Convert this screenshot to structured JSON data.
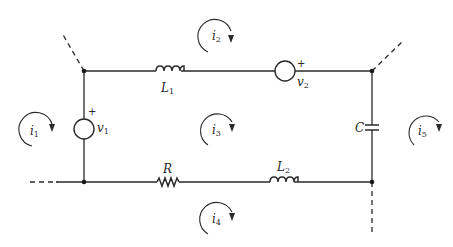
{
  "diagram": {
    "type": "circuit",
    "colors": {
      "ink": "#2a2a2a",
      "background": "#ffffff"
    },
    "components": {
      "L1": {
        "symbol": "L",
        "sub": "1",
        "kind": "inductor",
        "branch": "top"
      },
      "v2": {
        "symbol": "v",
        "sub": "2",
        "kind": "voltage-source",
        "branch": "top",
        "polarity": "+"
      },
      "v1": {
        "symbol": "v",
        "sub": "1",
        "kind": "voltage-source",
        "branch": "left",
        "polarity": "+"
      },
      "C": {
        "symbol": "C",
        "sub": "",
        "kind": "capacitor",
        "branch": "right"
      },
      "R": {
        "symbol": "R",
        "sub": "",
        "kind": "resistor",
        "branch": "bottom"
      },
      "L2": {
        "symbol": "L",
        "sub": "2",
        "kind": "inductor",
        "branch": "bottom"
      }
    },
    "mesh_currents": [
      {
        "symbol": "i",
        "sub": "1",
        "direction": "clockwise",
        "region": "left-outside"
      },
      {
        "symbol": "i",
        "sub": "2",
        "direction": "clockwise",
        "region": "top-outside"
      },
      {
        "symbol": "i",
        "sub": "3",
        "direction": "clockwise",
        "region": "center"
      },
      {
        "symbol": "i",
        "sub": "4",
        "direction": "clockwise",
        "region": "bottom-outside"
      },
      {
        "symbol": "i",
        "sub": "5",
        "direction": "clockwise",
        "region": "right-outside"
      }
    ],
    "polarity_mark": "+"
  }
}
